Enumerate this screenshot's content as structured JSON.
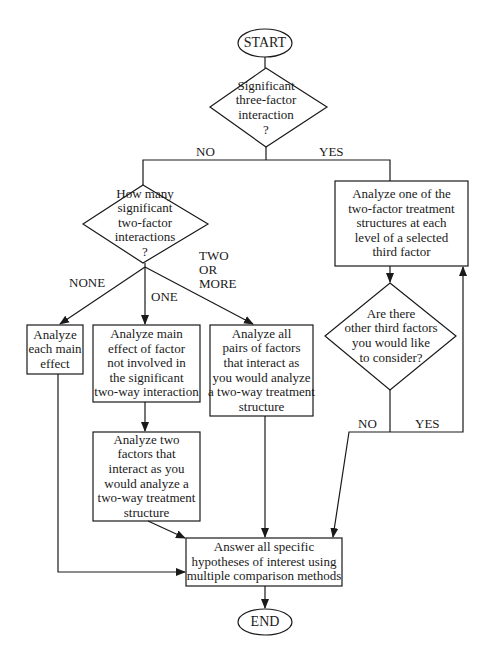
{
  "diagram": {
    "type": "flowchart",
    "title": "",
    "nodes": {
      "start": {
        "shape": "ellipse",
        "label": "START"
      },
      "q_three_factor": {
        "shape": "diamond",
        "label": "Significant\nthree-factor\ninteraction\n?"
      },
      "q_two_factor": {
        "shape": "diamond",
        "label": "How many\nsignificant\ntwo-factor\ninteractions\n?"
      },
      "analyze_main_effects": {
        "shape": "box",
        "label": "Analyze\neach main\neffect"
      },
      "analyze_main_effect_uninvolved": {
        "shape": "box",
        "label": "Analyze main\neffect of factor\nnot involved in\nthe significant\ntwo-way interaction"
      },
      "analyze_two_factors": {
        "shape": "box",
        "label": "Analyze two\nfactors that\ninteract as you\nwould analyze a\ntwo-way treatment\nstructure"
      },
      "analyze_all_pairs": {
        "shape": "box",
        "label": "Analyze all\npairs of factors\nthat interact as\nyou would analyze\na two-way treatment\nstructure"
      },
      "analyze_two_factor_per_level": {
        "shape": "box",
        "label": "Analyze one of the\ntwo-factor treatment\nstructures at each\nlevel of a selected\nthird factor"
      },
      "q_other_third_factors": {
        "shape": "diamond",
        "label": "Are there\nother third factors\nyou would like\nto consider?"
      },
      "answer_hypotheses": {
        "shape": "box",
        "label": "Answer all specific\nhypotheses of interest using\nmultiple comparison methods"
      },
      "end": {
        "shape": "ellipse",
        "label": "END"
      }
    },
    "edge_labels": {
      "three_factor_no": "NO",
      "three_factor_yes": "YES",
      "two_factor_none": "NONE",
      "two_factor_one": "ONE",
      "two_factor_two_or_more": "TWO\nOR\nMORE",
      "other_third_no": "NO",
      "other_third_yes": "YES"
    },
    "edges": [
      {
        "from": "start",
        "to": "q_three_factor",
        "label": ""
      },
      {
        "from": "q_three_factor",
        "to": "q_two_factor",
        "label": "NO"
      },
      {
        "from": "q_three_factor",
        "to": "analyze_two_factor_per_level",
        "label": "YES"
      },
      {
        "from": "q_two_factor",
        "to": "analyze_main_effects",
        "label": "NONE"
      },
      {
        "from": "q_two_factor",
        "to": "analyze_main_effect_uninvolved",
        "label": "ONE"
      },
      {
        "from": "q_two_factor",
        "to": "analyze_all_pairs",
        "label": "TWO OR MORE"
      },
      {
        "from": "analyze_main_effect_uninvolved",
        "to": "analyze_two_factors",
        "label": ""
      },
      {
        "from": "analyze_main_effects",
        "to": "answer_hypotheses",
        "label": ""
      },
      {
        "from": "analyze_two_factors",
        "to": "answer_hypotheses",
        "label": ""
      },
      {
        "from": "analyze_all_pairs",
        "to": "answer_hypotheses",
        "label": ""
      },
      {
        "from": "analyze_two_factor_per_level",
        "to": "q_other_third_factors",
        "label": ""
      },
      {
        "from": "q_other_third_factors",
        "to": "answer_hypotheses",
        "label": "NO"
      },
      {
        "from": "q_other_third_factors",
        "to": "analyze_two_factor_per_level",
        "label": "YES"
      },
      {
        "from": "answer_hypotheses",
        "to": "end",
        "label": ""
      }
    ],
    "colors": {
      "stroke": "#1a1a1a",
      "background": "#ffffff",
      "text": "#1a1a1a"
    }
  }
}
